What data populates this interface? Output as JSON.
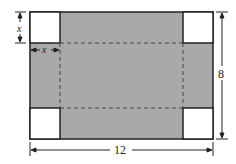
{
  "diagram": {
    "width_label": "12",
    "height_label": "8",
    "corner_width_label": "x",
    "corner_height_label": "x",
    "colors": {
      "fill": "#a9a9a9",
      "stroke": "#222222",
      "background": "#ffffff"
    }
  }
}
